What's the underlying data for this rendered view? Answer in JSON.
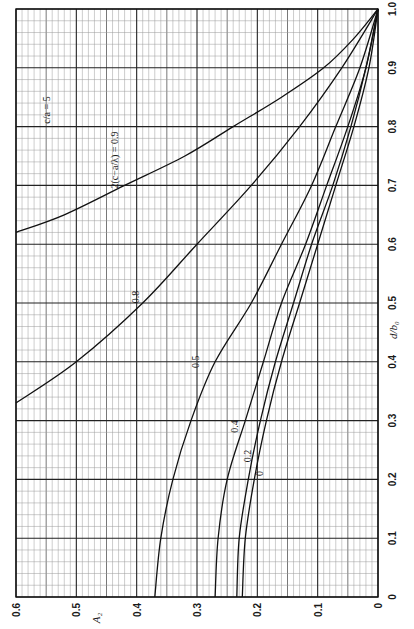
{
  "chart_data": {
    "type": "line",
    "title": "",
    "orientation": "rotated-90-clockwise",
    "xlabel": "d/b₀",
    "ylabel": "A₂",
    "xlim": [
      0,
      1.0
    ],
    "ylim": [
      0,
      0.6
    ],
    "grid": true,
    "x_ticks": [
      "0",
      "0.1",
      "0.2",
      "0.3",
      "0.4",
      "0.5",
      "0.6",
      "0.7",
      "0.8",
      "0.9",
      "1.0"
    ],
    "y_ticks": [
      "0",
      "0.1",
      "0.2",
      "0.3",
      "0.4",
      "0.5",
      "0.6"
    ],
    "annotations": {
      "ratio": "c/a = 5",
      "parameter": "2(c−a/λ) = 0.9"
    },
    "series": [
      {
        "name": "0.9",
        "label": "",
        "x": [
          0.62,
          0.65,
          0.7,
          0.75,
          0.8,
          0.85,
          0.9,
          0.95,
          1.0
        ],
        "y": [
          0.6,
          0.52,
          0.42,
          0.32,
          0.24,
          0.16,
          0.09,
          0.04,
          0.0
        ]
      },
      {
        "name": "0.8",
        "label": "0.8",
        "x": [
          0.33,
          0.4,
          0.5,
          0.6,
          0.7,
          0.8,
          0.9,
          1.0
        ],
        "y": [
          0.6,
          0.5,
          0.39,
          0.3,
          0.21,
          0.13,
          0.06,
          0.0
        ]
      },
      {
        "name": "0.5",
        "label": "0.5",
        "x": [
          0,
          0.1,
          0.2,
          0.3,
          0.4,
          0.5,
          0.6,
          0.7,
          0.8,
          0.9,
          1.0
        ],
        "y": [
          0.37,
          0.36,
          0.34,
          0.31,
          0.27,
          0.21,
          0.16,
          0.11,
          0.07,
          0.03,
          0.0
        ]
      },
      {
        "name": "0.4",
        "label": "0.4",
        "x": [
          0,
          0.1,
          0.2,
          0.3,
          0.4,
          0.5,
          0.6,
          0.7,
          0.8,
          0.9,
          1.0
        ],
        "y": [
          0.27,
          0.265,
          0.25,
          0.22,
          0.19,
          0.16,
          0.12,
          0.085,
          0.05,
          0.02,
          0.0
        ]
      },
      {
        "name": "0.2",
        "label": "0.2",
        "x": [
          0,
          0.1,
          0.2,
          0.3,
          0.4,
          0.5,
          0.6,
          0.7,
          0.8,
          0.9,
          1.0
        ],
        "y": [
          0.234,
          0.23,
          0.215,
          0.195,
          0.17,
          0.14,
          0.11,
          0.075,
          0.045,
          0.02,
          0.0
        ]
      },
      {
        "name": "0",
        "label": "0",
        "x": [
          0,
          0.1,
          0.2,
          0.3,
          0.4,
          0.5,
          0.6,
          0.7,
          0.8,
          0.9,
          1.0
        ],
        "y": [
          0.225,
          0.22,
          0.205,
          0.185,
          0.16,
          0.13,
          0.1,
          0.07,
          0.04,
          0.015,
          0.0
        ]
      }
    ],
    "label_positions": [
      {
        "series": "0.8",
        "x": 0.51,
        "y": 0.4
      },
      {
        "series": "0.5",
        "x": 0.4,
        "y": 0.3
      },
      {
        "series": "0.4",
        "x": 0.29,
        "y": 0.235
      },
      {
        "series": "0.2",
        "x": 0.24,
        "y": 0.215
      },
      {
        "series": "0",
        "x": 0.21,
        "y": 0.195
      }
    ]
  }
}
